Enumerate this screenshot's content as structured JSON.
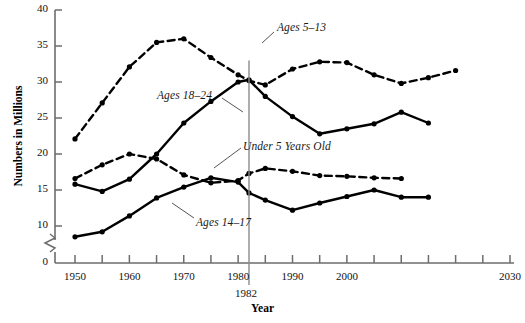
{
  "chart_data": {
    "type": "line",
    "title": "",
    "xlabel": "Year",
    "ylabel": "Numbers in Millions",
    "xlim": [
      1950,
      2030
    ],
    "ylim": [
      0,
      40
    ],
    "y_break": true,
    "y_break_between": [
      0,
      7
    ],
    "grid": false,
    "legend_position": "inline-annotations",
    "x_ticks": [
      1950,
      1955,
      1960,
      1965,
      1970,
      1975,
      1980,
      1985,
      1990,
      1995,
      2000,
      2005,
      2010,
      2015,
      2020,
      2025,
      2030
    ],
    "x_tick_labels": [
      "1950",
      "",
      "1960",
      "",
      "1970",
      "",
      "1980",
      "",
      "1990",
      "",
      "2000",
      "",
      "",
      "",
      "",
      "",
      "2030"
    ],
    "y_ticks": [
      0,
      10,
      15,
      20,
      25,
      30,
      35,
      40
    ],
    "y_tick_labels": [
      "0",
      "10",
      "15",
      "20",
      "25",
      "30",
      "35",
      "40"
    ],
    "annotations": [
      {
        "text": "1982",
        "x": 1982,
        "type": "vertical-reference-line"
      }
    ],
    "x": [
      1950,
      1955,
      1960,
      1965,
      1970,
      1975,
      1980,
      1982,
      1985,
      1990,
      1995,
      2000,
      2005,
      2010,
      2015,
      2020,
      2025,
      2030
    ],
    "series": [
      {
        "name": "Ages 5-13",
        "label": "Ages 5–13",
        "style": "dashed",
        "values": [
          22.1,
          27.1,
          32.1,
          35.5,
          36.0,
          33.4,
          31.0,
          30.2,
          29.6,
          31.8,
          32.8,
          32.7,
          31.0,
          29.8,
          30.6,
          31.6,
          null,
          null
        ]
      },
      {
        "name": "Ages 18-24",
        "label": "Ages 18–24",
        "style": "solid",
        "values": [
          15.8,
          14.8,
          16.5,
          20.0,
          24.3,
          27.3,
          30.0,
          30.3,
          28.0,
          25.2,
          22.8,
          23.5,
          24.2,
          25.8,
          24.3,
          null,
          null,
          null
        ]
      },
      {
        "name": "Under 5 Years Old",
        "label": "Under 5 Years Old",
        "style": "dashed",
        "values": [
          16.6,
          18.5,
          20.0,
          19.3,
          17.1,
          16.0,
          16.3,
          17.3,
          18.0,
          17.6,
          17.0,
          16.9,
          16.7,
          16.6,
          null,
          null,
          null,
          null
        ]
      },
      {
        "name": "Ages 14-17",
        "label": "Ages 14–17",
        "style": "solid",
        "values": [
          8.5,
          9.2,
          11.4,
          13.9,
          15.4,
          16.7,
          16.1,
          14.6,
          13.6,
          12.2,
          13.2,
          14.1,
          15.0,
          14.0,
          14.0,
          null,
          null,
          null
        ]
      }
    ],
    "series_label_positions": [
      {
        "name": "Ages 5-13",
        "x_px": 277,
        "y_px": 21
      },
      {
        "name": "Ages 18-24",
        "x_px": 157,
        "y_px": 89
      },
      {
        "name": "Under 5 Years Old",
        "x_px": 243,
        "y_px": 140
      },
      {
        "name": "Ages 14-17",
        "x_px": 196,
        "y_px": 216
      }
    ]
  }
}
